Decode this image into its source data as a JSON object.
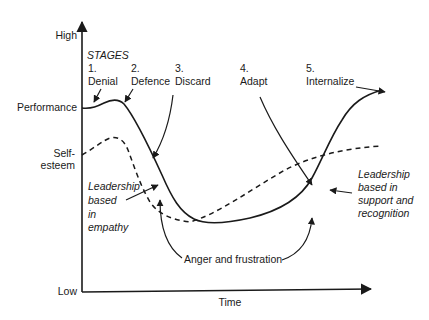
{
  "axes": {
    "y_high": "High",
    "y_low": "Low",
    "x_label": "Time"
  },
  "series_labels": {
    "performance": "Performance",
    "self_esteem_1": "Self-",
    "self_esteem_2": "esteem"
  },
  "stages": {
    "heading": "STAGES",
    "items": [
      {
        "num": "1.",
        "name": "Denial"
      },
      {
        "num": "2.",
        "name": "Defence"
      },
      {
        "num": "3.",
        "name": "Discard"
      },
      {
        "num": "4.",
        "name": "Adapt"
      },
      {
        "num": "5.",
        "name": "Internalize"
      }
    ]
  },
  "annotations": {
    "empathy": [
      "Leadership",
      "based",
      "in",
      "empathy"
    ],
    "support": [
      "Leadership",
      "based in",
      "support and",
      "recognition"
    ],
    "anger": "Anger and frustration"
  },
  "colors": {
    "ink": "#1a1a1a",
    "background": "#ffffff"
  }
}
